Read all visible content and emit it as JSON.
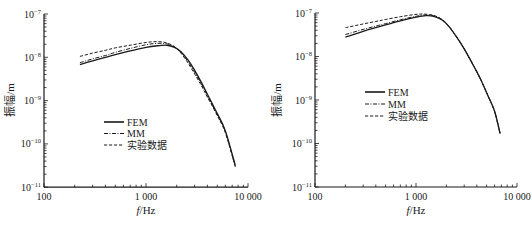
{
  "chart_data": [
    {
      "type": "line",
      "title": "",
      "xlabel": "f/Hz",
      "xlabel_italic_part": "f",
      "xlabel_rest": "/Hz",
      "ylabel": "振幅/m",
      "xscale": "log",
      "yscale": "log",
      "xlim": [
        100,
        10000
      ],
      "ylim": [
        1e-11,
        1e-07
      ],
      "xticks": [
        100,
        1000,
        10000
      ],
      "xtick_labels": [
        "100",
        "1 000",
        "10 000"
      ],
      "yticks": [
        1e-07,
        1e-08,
        1e-09,
        1e-10,
        1e-11
      ],
      "ytick_exponents": [
        "-7",
        "-8",
        "-9",
        "-10",
        "-11"
      ],
      "grid": false,
      "legend_position": "center-left",
      "legend": [
        "FEM",
        "MM",
        "实验数据"
      ],
      "series": [
        {
          "name": "FEM",
          "style": "solid",
          "x": [
            225,
            300,
            400,
            500,
            700,
            1000,
            1300,
            1600,
            1900,
            2200,
            2600,
            3000,
            3500,
            4000,
            5000,
            6000,
            7500
          ],
          "values": [
            6.8e-09,
            8.3e-09,
            1e-08,
            1.15e-08,
            1.4e-08,
            1.7e-08,
            1.85e-08,
            1.9e-08,
            1.7e-08,
            1.35e-08,
            8.5e-09,
            5e-09,
            2.6e-09,
            1.4e-09,
            5e-10,
            2e-10,
            3.2e-11
          ]
        },
        {
          "name": "MM",
          "style": "dashdot",
          "x": [
            225,
            300,
            400,
            500,
            700,
            1000,
            1300,
            1600,
            1900,
            2200,
            2600,
            3000,
            3500,
            4000,
            5000,
            6000,
            7500
          ],
          "values": [
            7.5e-09,
            9.2e-09,
            1.1e-08,
            1.3e-08,
            1.6e-08,
            1.95e-08,
            2.1e-08,
            2.05e-08,
            1.75e-08,
            1.3e-08,
            7.8e-09,
            4.5e-09,
            2.4e-09,
            1.3e-09,
            4.7e-10,
            1.9e-10,
            3e-11
          ]
        },
        {
          "name": "实验数据",
          "style": "dashed",
          "x": [
            225,
            300,
            400,
            500,
            700,
            1000,
            1300,
            1600,
            1900,
            2200,
            2600,
            3000,
            3500,
            4000,
            5000,
            6000,
            7500
          ],
          "values": [
            1.05e-08,
            1.25e-08,
            1.45e-08,
            1.65e-08,
            1.9e-08,
            2.2e-08,
            2.3e-08,
            2.15e-08,
            1.75e-08,
            1.25e-08,
            7.2e-09,
            4.1e-09,
            2.2e-09,
            1.2e-09,
            4.5e-10,
            1.8e-10,
            3e-11
          ]
        }
      ]
    },
    {
      "type": "line",
      "title": "",
      "xlabel": "f/Hz",
      "xlabel_italic_part": "f",
      "xlabel_rest": "/Hz",
      "ylabel": "振幅/m",
      "xscale": "log",
      "yscale": "log",
      "xlim": [
        100,
        10000
      ],
      "ylim": [
        1e-11,
        1e-07
      ],
      "xticks": [
        100,
        1000,
        10000
      ],
      "xtick_labels": [
        "100",
        "1 000",
        "10 000"
      ],
      "yticks": [
        1e-07,
        1e-08,
        1e-09,
        1e-10,
        1e-11
      ],
      "ytick_exponents": [
        "-7",
        "-8",
        "-9",
        "-10",
        "-11"
      ],
      "grid": false,
      "legend_position": "center-left",
      "legend": [
        "FEM",
        "MM",
        "实验数据"
      ],
      "series": [
        {
          "name": "FEM",
          "style": "solid",
          "x": [
            200,
            300,
            400,
            500,
            700,
            1000,
            1250,
            1500,
            1800,
            2100,
            2500,
            3000,
            3600,
            4300,
            5200,
            6000,
            6800
          ],
          "values": [
            2.8e-08,
            3.8e-08,
            4.6e-08,
            5.3e-08,
            6.6e-08,
            8e-08,
            8.7e-08,
            8.4e-08,
            7e-08,
            5e-08,
            2.9e-08,
            1.5e-08,
            7e-09,
            3.2e-09,
            1.2e-09,
            5.5e-10,
            1.7e-10
          ]
        },
        {
          "name": "MM",
          "style": "dashdot",
          "x": [
            200,
            300,
            400,
            500,
            700,
            1000,
            1250,
            1500,
            1800,
            2100,
            2500,
            3000,
            3600,
            4300,
            5200,
            6000,
            6800
          ],
          "values": [
            3.2e-08,
            4.2e-08,
            5e-08,
            5.7e-08,
            7e-08,
            8.4e-08,
            9e-08,
            8.6e-08,
            7.1e-08,
            5.1e-08,
            2.9e-08,
            1.5e-08,
            7e-09,
            3.2e-09,
            1.2e-09,
            5.5e-10,
            1.7e-10
          ]
        },
        {
          "name": "实验数据",
          "style": "dashed",
          "x": [
            200,
            300,
            400,
            500,
            700,
            1000,
            1250,
            1500,
            1800,
            2100,
            2500,
            3000,
            3600,
            4300,
            5200,
            6000,
            6800
          ],
          "values": [
            4.6e-08,
            5.6e-08,
            6.4e-08,
            7.1e-08,
            8.2e-08,
            9.3e-08,
            9.4e-08,
            8.8e-08,
            7.2e-08,
            5.1e-08,
            2.9e-08,
            1.5e-08,
            7e-09,
            3.2e-09,
            1.2e-09,
            5.5e-10,
            1.7e-10
          ]
        }
      ]
    }
  ],
  "layout": {
    "panels": [
      {
        "x0": 44,
        "x_decade_px": 102,
        "y_top": 14,
        "y_decade_px": 43.3,
        "legend": {
          "x": 104,
          "y": 122,
          "row_gap": 11.5
        },
        "ylabel_pos": {
          "x": 10,
          "y": 100
        }
      },
      {
        "x0": 315,
        "x_decade_px": 101,
        "y_top": 13,
        "y_decade_px": 43.5,
        "legend": {
          "x": 365,
          "y": 92,
          "row_gap": 12
        },
        "ylabel_pos": {
          "x": 277,
          "y": 100
        }
      }
    ],
    "line_color": "#1a1a1a",
    "axis_color": "#1a1a1a"
  }
}
